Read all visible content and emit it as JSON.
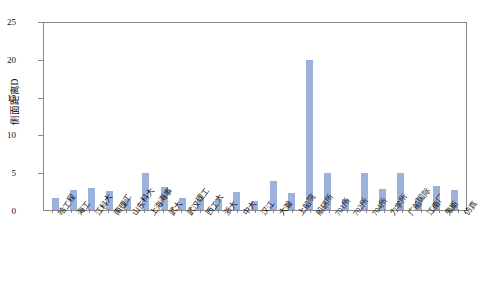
{
  "chart_data": {
    "type": "bar",
    "title": "",
    "subtitle": "",
    "xlabel": "",
    "ylabel": "侧面距离D",
    "ylim": [
      0,
      25
    ],
    "yticks": [
      0,
      5,
      10,
      15,
      20,
      25
    ],
    "grid": false,
    "legend": null,
    "bar_color": "#9bb2dc",
    "axis_color": "#8a8a8a",
    "categories": [
      "哈工程",
      "海工",
      "江科大",
      "南理工",
      "山东科大",
      "上海海事",
      "武大",
      "武汉理工",
      "西工大",
      "浙大",
      "中大",
      "汉江",
      "大瀚",
      "上船院",
      "船研所",
      "701所",
      "702所",
      "704所",
      "力学所",
      "广船国际",
      "江南厂",
      "鬼斯",
      "仿真"
    ],
    "values": [
      1.6,
      2.7,
      2.9,
      2.6,
      1.5,
      5.0,
      3.1,
      1.6,
      1.5,
      1.5,
      2.4,
      1.2,
      3.9,
      2.3,
      20.0,
      5.0,
      1.5,
      5.0,
      2.8,
      5.0,
      1.6,
      3.2,
      2.7
    ]
  }
}
